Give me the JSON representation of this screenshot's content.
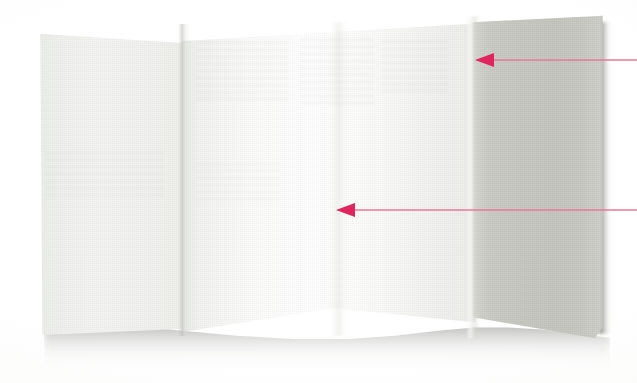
{
  "figure": {
    "kind": "photograph",
    "background_color": "#ffffff",
    "width": 637,
    "height": 383
  },
  "paper": {
    "panels": [
      {
        "id": "left-panel",
        "name": "Left panel",
        "fill_color": "#f2f3f0",
        "x": 40,
        "y": 33,
        "width": 143,
        "height": 305,
        "note": "near-white, slightly shaded, top edge slopes gently downward"
      },
      {
        "id": "middle-panel",
        "name": "Middle panel",
        "fill_color": "#fdfdfc",
        "x": 183,
        "y": 22,
        "width": 290,
        "height": 318,
        "note": "brightest panel, faces the light source directly"
      },
      {
        "id": "right-panel",
        "name": "Right panel",
        "fill_color": "#c8c9c2",
        "x": 473,
        "y": 18,
        "width": 130,
        "height": 318,
        "note": "angled away from the light, reads as a warm gray"
      }
    ],
    "creases": [
      {
        "id": "crease-left",
        "name": "Left fold crease",
        "x": 183
      },
      {
        "id": "crease-middle",
        "name": "Middle soft crease",
        "x": 340
      },
      {
        "id": "crease-right",
        "name": "Right fold crease",
        "x": 473
      }
    ],
    "shadow": {
      "name": "Cast shadow",
      "color": "#4a4a48",
      "note": "soft wavy shadow beneath the undulating bottom edge and along the right edge"
    }
  },
  "annotations": {
    "arrow_color": "#e0245e",
    "line_color": "#e77a97",
    "items": [
      {
        "id": "arrow-1",
        "name": "Upper annotation arrow",
        "label": "",
        "tip_x": 475,
        "tip_y": 60,
        "tail_x": 637,
        "tail_y": 60,
        "direction": "left",
        "points_at": "right-panel"
      },
      {
        "id": "arrow-2",
        "name": "Lower annotation arrow",
        "label": "",
        "tip_x": 336,
        "tip_y": 210,
        "tail_x": 637,
        "tail_y": 210,
        "direction": "left",
        "points_at": "middle-panel"
      }
    ]
  }
}
